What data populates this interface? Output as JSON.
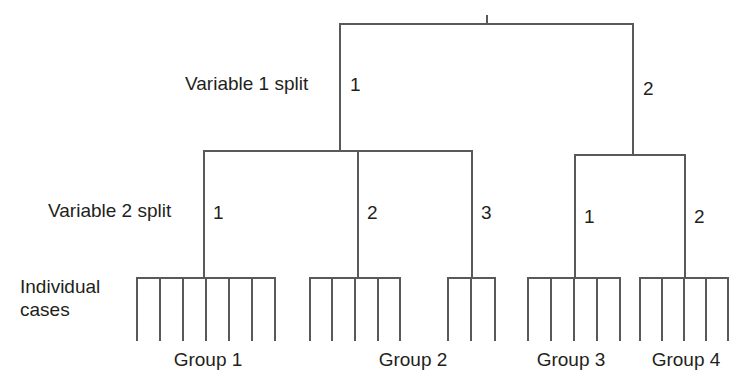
{
  "figure": {
    "type": "tree-diagram",
    "title": "",
    "background_color": "#ffffff",
    "line_color": "#58595b",
    "text_color": "#231f20",
    "line_width": 2
  },
  "row_labels": {
    "variable1": "Variable 1 split",
    "variable2": "Variable 2 split",
    "individual_line1": "Individual",
    "individual_line2": "cases"
  },
  "level1_branches": [
    {
      "id": "v1-branch-1",
      "label": "1"
    },
    {
      "id": "v1-branch-2",
      "label": "2"
    }
  ],
  "level2_branches_left": [
    {
      "id": "v2-left-branch-1",
      "label": "1"
    },
    {
      "id": "v2-left-branch-2",
      "label": "2"
    },
    {
      "id": "v2-left-branch-3",
      "label": "3"
    }
  ],
  "level2_branches_right": [
    {
      "id": "v2-right-branch-1",
      "label": "1"
    },
    {
      "id": "v2-right-branch-2",
      "label": "2"
    }
  ],
  "groups": [
    {
      "id": "group-1",
      "label": "Group 1",
      "cases": 7
    },
    {
      "id": "group-2",
      "label": "Group 2",
      "cases": 8
    },
    {
      "id": "group-3",
      "label": "Group 3",
      "cases": 5
    },
    {
      "id": "group-4",
      "label": "Group 4",
      "cases": 5
    }
  ],
  "leaf_clusters": [
    {
      "id": "cluster-a",
      "group": "Group 1",
      "cases": 7
    },
    {
      "id": "cluster-b",
      "group": "Group 2",
      "cases": 5
    },
    {
      "id": "cluster-c",
      "group": "Group 2",
      "cases": 3
    },
    {
      "id": "cluster-d",
      "group": "Group 3",
      "cases": 5
    },
    {
      "id": "cluster-e",
      "group": "Group 4",
      "cases": 5
    }
  ]
}
